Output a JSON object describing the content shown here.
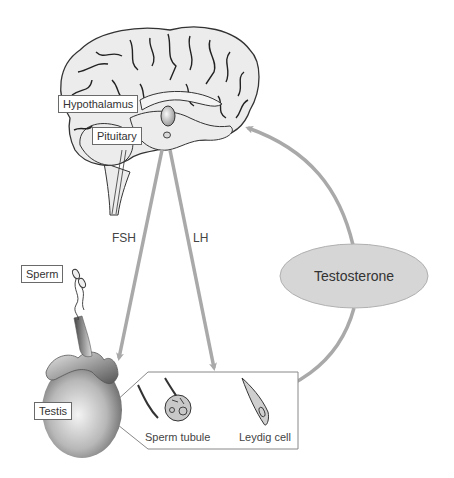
{
  "diagram": {
    "labels": {
      "hypothalamus": "Hypothalamus",
      "pituitary": "Pituitary",
      "fsh": "FSH",
      "lh": "LH",
      "testosterone": "Testosterone",
      "sperm": "Sperm",
      "testis": "Testis",
      "sperm_tubule": "Sperm tubule",
      "leydig_cell": "Leydig cell"
    },
    "arrows": [
      {
        "from": "pituitary",
        "to": "testis",
        "label": "FSH"
      },
      {
        "from": "pituitary",
        "to": "callout-box",
        "label": "LH"
      },
      {
        "from": "testosterone",
        "to": "brain",
        "label": ""
      },
      {
        "from": "testosterone",
        "to": "sperm_tubule",
        "label": ""
      }
    ],
    "colors": {
      "arrow": "#a9a9a9",
      "ellipse_fill": "#d6d6d6",
      "brain_fill": "#ececec",
      "outline": "#333333",
      "box_border": "#6a6a6a"
    }
  }
}
